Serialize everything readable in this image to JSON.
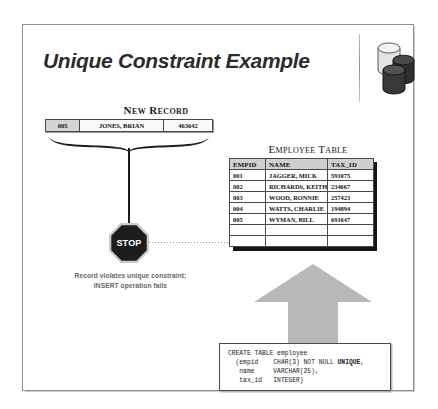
{
  "slide": {
    "title": "Unique Constraint Example",
    "icon": "database-cylinders-icon"
  },
  "new_record": {
    "label": "New Record",
    "empid": "005",
    "name": "JONES, BRIAN",
    "tax_id": "463642"
  },
  "stop": {
    "label": "STOP",
    "icon": "stop-sign-icon"
  },
  "violation": {
    "line1": "Record violates unique constraint;",
    "line2": "INSERT operation fails"
  },
  "employee_table": {
    "title": "Employee Table",
    "columns": [
      "EMPID",
      "NAME",
      "TAX_ID"
    ],
    "rows": [
      {
        "empid": "001",
        "name": "JAGGER, MICK",
        "tax_id": "591075"
      },
      {
        "empid": "002",
        "name": "RICHARDS, KEITH",
        "tax_id": "234667"
      },
      {
        "empid": "003",
        "name": "WOOD, RONNIE",
        "tax_id": "257423"
      },
      {
        "empid": "004",
        "name": "WATTS, CHARLIE",
        "tax_id": "194894"
      },
      {
        "empid": "005",
        "name": "WYMAN, BILL",
        "tax_id": "691647"
      }
    ],
    "empty_rows": 2
  },
  "sql": {
    "line1": "CREATE TABLE employee",
    "line2_pre": "  (empid    CHAR(3) NOT NULL ",
    "line2_keyword": "UNIQUE",
    "line2_post": ",",
    "line3": "   name     VARCHAR(25),",
    "line4": "   tax_id   INTEGER)"
  },
  "colors": {
    "accent_gray": "#c0c0c0",
    "title_color": "#2b2b2b",
    "header_fill": "#cfcfcf",
    "stop_fill": "#1d1d1d"
  }
}
